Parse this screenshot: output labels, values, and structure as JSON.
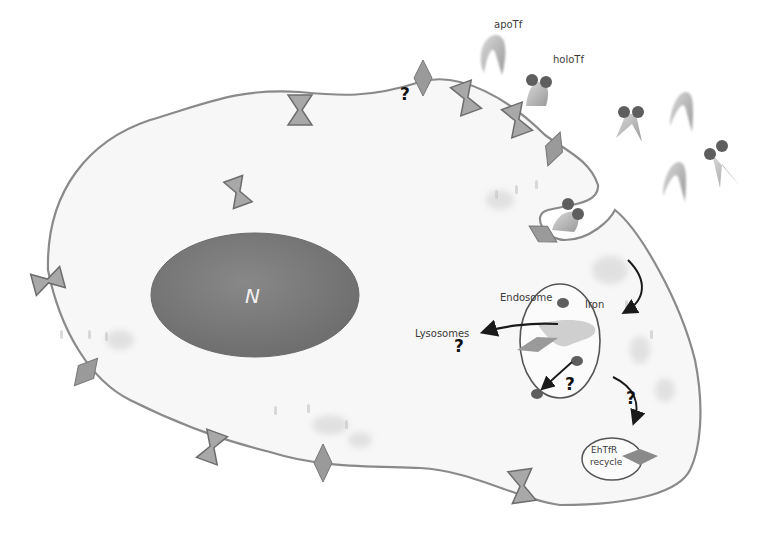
{
  "diagram": {
    "type": "cell-biology-schematic",
    "colors": {
      "membrane": "#8a8a8a",
      "cytoplasm": "#f7f7f7",
      "nucleus": "#7b7b7b",
      "receptor": "#9a9a9a",
      "iron_lobe": "#5e5e5e",
      "arrow": "#1a1a1a",
      "text": "#3a3a3a"
    },
    "labels": {
      "apoTf": "apoTf",
      "holoTf": "holoTf",
      "nucleus": "N",
      "endosome": "Endosome",
      "iron": "Iron",
      "lysosomes": "Lysosomes",
      "recycle_line1": "EhTfR",
      "recycle_line2": "recycle"
    },
    "question_marks": [
      {
        "id": "q-membrane-top",
        "text": "?"
      },
      {
        "id": "q-lysosomes",
        "text": "?"
      },
      {
        "id": "q-iron-release",
        "text": "?"
      },
      {
        "id": "q-recycle",
        "text": "?"
      }
    ],
    "nodes": [
      {
        "id": "cell",
        "kind": "cell-body"
      },
      {
        "id": "nucleus",
        "kind": "organelle",
        "label": "N"
      },
      {
        "id": "endosome",
        "kind": "vesicle",
        "label": "Endosome"
      },
      {
        "id": "recycle-vesicle",
        "kind": "vesicle",
        "label": "EhTfR recycle"
      },
      {
        "id": "lysosomes",
        "kind": "destination",
        "label": "Lysosomes"
      },
      {
        "id": "apoTf",
        "kind": "ligand",
        "label": "apoTf"
      },
      {
        "id": "holoTf",
        "kind": "ligand",
        "label": "holoTf"
      }
    ],
    "edges": [
      {
        "from": "membrane-invagination",
        "to": "endosome",
        "label": ""
      },
      {
        "from": "endosome",
        "to": "lysosomes",
        "label": "?"
      },
      {
        "from": "endosome",
        "to": "iron-cytosol",
        "label": "?"
      },
      {
        "from": "endosome",
        "to": "recycle-vesicle",
        "label": "?"
      }
    ]
  }
}
